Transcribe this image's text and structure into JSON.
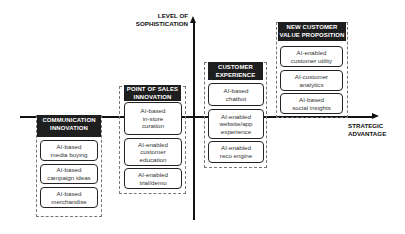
{
  "axes": {
    "y_label_line1": "LEVEL OF",
    "y_label_line2": "SOPHISTICATION",
    "x_label_line1": "STRATEGIC",
    "x_label_line2": "ADVANTAGE"
  },
  "groups": [
    {
      "title_line1": "COMMUNICATION",
      "title_line2": "INNOVATION",
      "items": [
        {
          "line1": "AI-based",
          "line2": "media buying"
        },
        {
          "line1": "AI-based",
          "line2": "campaign ideas"
        },
        {
          "line1": "AI-based",
          "line2": "merchandise"
        }
      ]
    },
    {
      "title_line1": "POINT OF SALES",
      "title_line2": "INNOVATION",
      "items": [
        {
          "line1": "AI-based",
          "line2": "in-store",
          "line3": "curation"
        },
        {
          "line1": "AI-enabled",
          "line2": "customer",
          "line3": "education"
        },
        {
          "line1": "AI-enabled",
          "line2": "trial/demo"
        }
      ]
    },
    {
      "title_line1": "CUSTOMER",
      "title_line2": "EXPERIENCE",
      "items": [
        {
          "line1": "AI-based",
          "line2": "chatbot"
        },
        {
          "line1": "AI-enabled",
          "line2": "website/app",
          "line3": "experience"
        },
        {
          "line1": "AI-enabled",
          "line2": "reco engine"
        }
      ]
    },
    {
      "title_line1": "NEW CUSTOMER",
      "title_line2": "VALUE PROPOSITION",
      "items": [
        {
          "line1": "AI-enabled",
          "line2": "customer utility"
        },
        {
          "line1": "AI-customer",
          "line2": "analytics"
        },
        {
          "line1": "AI-based",
          "line2": "social insights"
        }
      ]
    }
  ]
}
